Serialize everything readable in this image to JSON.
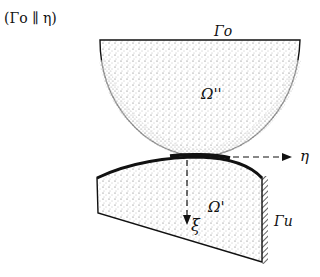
{
  "diagram": {
    "caption": "(Γo ∥ η)",
    "bodies": {
      "upper": {
        "label": "Ω''",
        "boundary_label": "Γo"
      },
      "lower": {
        "label": "Ω'",
        "boundary_label": "Γu"
      }
    },
    "axes": {
      "horizontal": "η",
      "vertical": "ξ"
    },
    "colors": {
      "ink": "#111111",
      "background": "#ffffff",
      "stipple": "#555555"
    }
  }
}
